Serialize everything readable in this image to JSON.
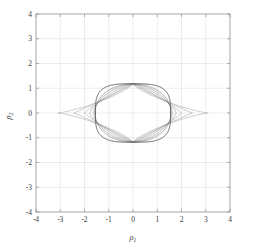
{
  "chart_data": {
    "type": "line",
    "title": "",
    "subtitle": "",
    "xlabel": "ρ₁",
    "ylabel": "ρ₂",
    "xlabel_base": "ρ",
    "xlabel_sub": "1",
    "ylabel_base": "ρ",
    "ylabel_sub": "2",
    "xlim": [
      -4,
      4
    ],
    "ylim": [
      -4,
      4
    ],
    "grid": true,
    "legend": "none",
    "xticks": [
      -4,
      -3,
      -2,
      -1,
      0,
      1,
      2,
      3,
      4
    ],
    "yticks": [
      -4,
      -3,
      -2,
      -1,
      0,
      1,
      2,
      3,
      4
    ],
    "xtick_labels": [
      "-4",
      "-3",
      "-2",
      "-1",
      "0",
      "1",
      "2",
      "3",
      "4"
    ],
    "ytick_labels": [
      "-4",
      "-3",
      "-2",
      "-1",
      "0",
      "1",
      "2",
      "3",
      "4"
    ],
    "axis_color": "#808080",
    "grid_color": "#d9d9d9",
    "curve_color": "#6e6e6e",
    "curve_color_outer": "#4d4d4d",
    "background": "#ffffff",
    "series": [
      {
        "name": "contour-1-lens-widest",
        "half_width": 3.1,
        "half_height": 1.17,
        "exponent": 0.8,
        "line_width": 0.5,
        "color": "#9a9a9a"
      },
      {
        "name": "contour-2-lens",
        "half_width": 2.45,
        "half_height": 1.17,
        "exponent": 0.95,
        "line_width": 0.5,
        "color": "#909090"
      },
      {
        "name": "contour-3-lens",
        "half_width": 2.0,
        "half_height": 1.17,
        "exponent": 1.12,
        "line_width": 0.5,
        "color": "#888888"
      },
      {
        "name": "contour-4-oval",
        "half_width": 1.78,
        "half_height": 1.17,
        "exponent": 1.35,
        "line_width": 0.5,
        "color": "#828282"
      },
      {
        "name": "contour-5-oval",
        "half_width": 1.62,
        "half_height": 1.17,
        "exponent": 1.7,
        "line_width": 0.55,
        "color": "#7a7a7a"
      },
      {
        "name": "contour-6-ellipse",
        "half_width": 1.56,
        "half_height": 1.17,
        "exponent": 2.1,
        "line_width": 0.6,
        "color": "#707070"
      },
      {
        "name": "contour-7-superellipse-outer",
        "half_width": 1.55,
        "half_height": 1.18,
        "exponent": 3.4,
        "line_width": 0.9,
        "color": "#555555"
      }
    ]
  }
}
